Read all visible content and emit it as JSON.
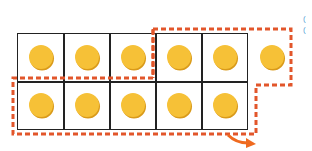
{
  "diagram": {
    "title": "",
    "ten_frame": {
      "rows": 2,
      "columns": 5,
      "border_color": "#222222"
    },
    "counters": {
      "color": "#f6c137",
      "top_row_in_frame": 5,
      "top_row_outside_frame": 1,
      "bottom_row_in_frame": 5,
      "total": 11
    },
    "groupings": [
      {
        "name": "top-right-group",
        "description": "dashed outline around 3 right cells of top row plus extra counter",
        "color": "#e2562b"
      },
      {
        "name": "left-bottom-group",
        "description": "dashed outline around 3 left cells of top row and full bottom row",
        "color": "#e2562b"
      }
    ],
    "arrow": {
      "color": "#ef6a1f",
      "direction": "down-right"
    },
    "edge_marks": [
      "(",
      "("
    ]
  }
}
